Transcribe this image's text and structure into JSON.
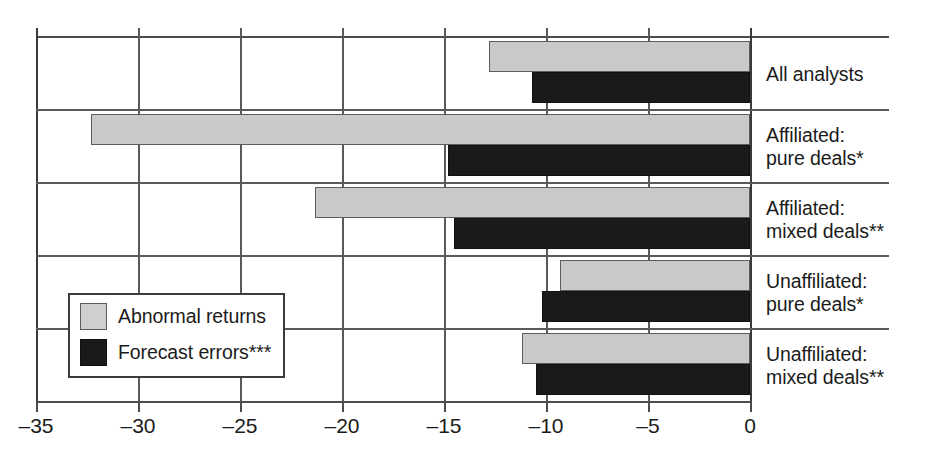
{
  "chart_data": {
    "type": "bar",
    "orientation": "horizontal",
    "title": "",
    "xlabel": "",
    "ylabel": "",
    "xlim": [
      -35,
      0
    ],
    "xticks": [
      -35,
      -30,
      -25,
      -20,
      -15,
      -10,
      -5,
      0
    ],
    "xticklabels": [
      "–35",
      "–30",
      "–25",
      "–20",
      "–15",
      "–10",
      "–5",
      "0"
    ],
    "grid": true,
    "grid_axis": "both",
    "legend_position": "inside-left-lower",
    "categories": [
      "All analysts",
      "Affiliated:\npure deals*",
      "Affiliated:\nmixed deals**",
      "Unaffiliated:\npure deals*",
      "Unaffiliated:\nmixed deals**"
    ],
    "series": [
      {
        "name": "Abnormal returns",
        "color": "#c9c9c9",
        "values": [
          -12.8,
          -32.3,
          -21.3,
          -9.3,
          -11.2
        ]
      },
      {
        "name": "Forecast errors***",
        "color": "#1c1a18",
        "values": [
          -10.7,
          -14.8,
          -14.5,
          -10.2,
          -10.5
        ]
      }
    ]
  },
  "legend": {
    "items": [
      {
        "label": "Abnormal returns",
        "swatch": "gray"
      },
      {
        "label": "Forecast errors***",
        "swatch": "black"
      }
    ]
  },
  "axis": {
    "tick_labels": [
      "–35",
      "–30",
      "–25",
      "–20",
      "–15",
      "–10",
      "–5",
      "0"
    ]
  },
  "categories": [
    "All analysts",
    "Affiliated:\npure deals*",
    "Affiliated:\nmixed deals**",
    "Unaffiliated:\npure deals*",
    "Unaffiliated:\nmixed deals**"
  ]
}
